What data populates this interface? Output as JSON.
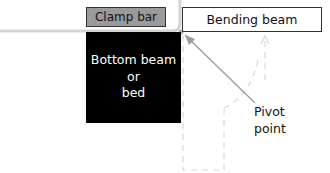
{
  "diagram": {
    "clamp_bar": {
      "label": "Clamp bar",
      "fill": "#9a9a9a"
    },
    "bending_beam": {
      "label": "Bending beam",
      "fill": "#ffffff"
    },
    "bottom_beam": {
      "line1": "Bottom beam",
      "line2": "or",
      "line3": "bed",
      "fill": "#000000"
    },
    "pivot": {
      "line1": "Pivot",
      "line2": "point"
    },
    "colors": {
      "sheet": "#d4d4d4",
      "arrow": "#9a9a9a",
      "dashed": "#d8d8d8"
    }
  }
}
